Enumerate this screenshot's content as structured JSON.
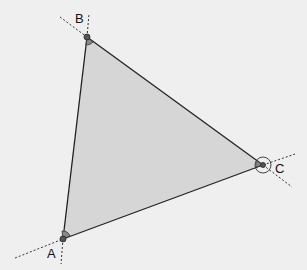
{
  "diagram": {
    "fill_color": "#d6d6d6",
    "stroke_color": "#222222",
    "background_color": "#efefef",
    "vertices": [
      {
        "id": "A",
        "label": "A"
      },
      {
        "id": "B",
        "label": "B"
      },
      {
        "id": "C",
        "label": "C"
      }
    ]
  }
}
